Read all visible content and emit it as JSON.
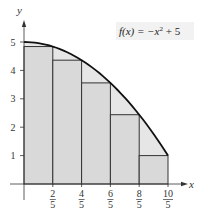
{
  "chart_data": {
    "type": "area",
    "title": "",
    "function_label": "f(x) = -x² + 5",
    "xlabel": "x",
    "ylabel": "y",
    "xlim": [
      0,
      2.2
    ],
    "ylim": [
      0,
      5.4
    ],
    "grid": false,
    "x_ticks": [
      {
        "value": 0.4,
        "num": "2",
        "den": "5"
      },
      {
        "value": 0.8,
        "num": "4",
        "den": "5"
      },
      {
        "value": 1.2,
        "num": "6",
        "den": "5"
      },
      {
        "value": 1.6,
        "num": "8",
        "den": "5"
      },
      {
        "value": 2.0,
        "num": "10",
        "den": "5"
      }
    ],
    "y_ticks": [
      1,
      2,
      3,
      4,
      5
    ],
    "curve": {
      "expression": "-x^2 + 5",
      "x": [
        0,
        0.2,
        0.4,
        0.6,
        0.8,
        1.0,
        1.2,
        1.4,
        1.6,
        1.8,
        2.0
      ],
      "y": [
        5,
        4.96,
        4.84,
        4.64,
        4.36,
        4,
        3.56,
        3.04,
        2.44,
        1.76,
        1
      ]
    },
    "rectangles": {
      "description": "Inscribed rectangles (right endpoints)",
      "x_left": [
        0,
        0.4,
        0.8,
        1.2,
        1.6
      ],
      "width": 0.4,
      "heights": [
        4.84,
        4.36,
        3.56,
        2.44,
        1
      ]
    },
    "colors": {
      "region_fill": "#e6e6e6",
      "rect_fill": "#d9d9d9",
      "curve": "#111111",
      "axis": "#333333",
      "rect_stroke": "#333333"
    }
  }
}
